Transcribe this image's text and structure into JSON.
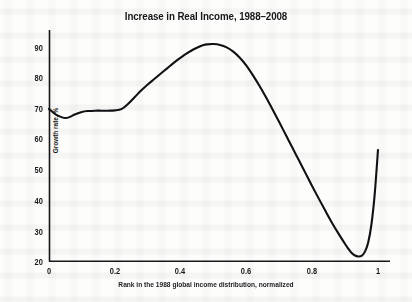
{
  "chart_data": {
    "type": "line",
    "title": "Increase in Real Income, 1988–2008",
    "xlabel": "Rank in the 1988 global income distribution, normalized",
    "ylabel": "Growth rate, %",
    "xlim": [
      0,
      1
    ],
    "ylim": [
      20,
      92
    ],
    "grid": false,
    "legend": "none",
    "line_color": "#111114",
    "background_color": "#fdfdfb",
    "xticks": [
      "0",
      "0.2",
      "0.4",
      "0.6",
      "0.8",
      "1"
    ],
    "xtick_values": [
      0,
      0.2,
      0.4,
      0.6,
      0.8,
      1
    ],
    "yticks": [
      "20",
      "30",
      "40",
      "50",
      "60",
      "70",
      "80",
      "90"
    ],
    "ytick_values": [
      20,
      30,
      40,
      50,
      60,
      70,
      80,
      90
    ],
    "series": [
      {
        "name": "Real income growth rate",
        "x": [
          0.0,
          0.02,
          0.04,
          0.05,
          0.06,
          0.08,
          0.1,
          0.12,
          0.14,
          0.16,
          0.18,
          0.2,
          0.22,
          0.24,
          0.26,
          0.28,
          0.3,
          0.32,
          0.34,
          0.36,
          0.38,
          0.4,
          0.42,
          0.44,
          0.46,
          0.47,
          0.48,
          0.5,
          0.52,
          0.54,
          0.56,
          0.58,
          0.6,
          0.62,
          0.64,
          0.66,
          0.68,
          0.7,
          0.72,
          0.74,
          0.76,
          0.78,
          0.8,
          0.82,
          0.84,
          0.86,
          0.88,
          0.9,
          0.91,
          0.92,
          0.93,
          0.94,
          0.95,
          0.96,
          0.97,
          0.98,
          0.99,
          1.0
        ],
        "y": [
          70.0,
          68.2,
          67.2,
          67.0,
          67.2,
          68.2,
          69.0,
          69.3,
          69.4,
          69.4,
          69.4,
          69.5,
          69.9,
          71.6,
          73.8,
          76.0,
          78.0,
          79.8,
          81.6,
          83.4,
          85.2,
          86.8,
          88.3,
          89.6,
          90.6,
          91.0,
          91.2,
          91.3,
          91.0,
          90.2,
          88.8,
          86.8,
          84.2,
          81.0,
          77.5,
          73.7,
          69.7,
          65.6,
          61.4,
          57.2,
          53.0,
          48.8,
          44.6,
          40.5,
          36.5,
          32.6,
          29.0,
          25.6,
          24.0,
          22.6,
          21.8,
          21.5,
          21.7,
          23.0,
          26.0,
          32.0,
          42.0,
          56.5
        ]
      }
    ],
    "annotations": {
      "peak_x": 0.47,
      "peak_y": 91.3,
      "trough_x": 0.94,
      "trough_y": 21.5,
      "start_y": 70.0,
      "end_y": 56.5
    }
  },
  "axes": {
    "plot_left_px": 49,
    "plot_right_px": 378,
    "plot_top_px": 44,
    "plot_bottom_px": 261
  }
}
